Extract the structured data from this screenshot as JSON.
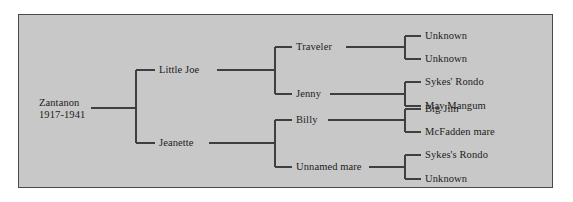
{
  "figure": {
    "type": "pedigree-chart",
    "panel_background": "#c8c8c8",
    "panel_border_color": "#4a4a4a",
    "page_background": "#ffffff",
    "line_color": "#3f3f3f",
    "text_color": "#1c1c1c"
  },
  "tree": {
    "root": {
      "name": "Zantanon",
      "dates": "1917-1941"
    },
    "generation2": [
      {
        "label": "Little Joe"
      },
      {
        "label": "Jeanette"
      }
    ],
    "generation3": [
      {
        "label": "Traveler"
      },
      {
        "label": "Jenny"
      },
      {
        "label": "Billy"
      },
      {
        "label": "Unnamed mare"
      }
    ],
    "generation4": [
      {
        "label": "Unknown"
      },
      {
        "label": "Unknown"
      },
      {
        "label": "Sykes' Rondo"
      },
      {
        "label": "May Mangum"
      },
      {
        "label": "Big Jim"
      },
      {
        "label": "McFadden mare"
      },
      {
        "label": "Sykes's Rondo"
      },
      {
        "label": "Unknown"
      }
    ]
  }
}
